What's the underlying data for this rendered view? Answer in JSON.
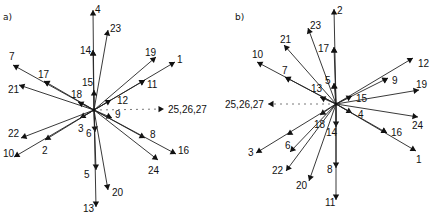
{
  "panels": [
    {
      "label": "a)",
      "center": [
        94,
        110
      ],
      "vectors": [
        {
          "id": "4",
          "end": [
            93,
            10
          ],
          "label_pos": [
            95,
            13
          ],
          "marks": [
            [
              93,
              50
            ]
          ]
        },
        {
          "id": "23",
          "end": [
            108,
            30
          ],
          "label_pos": [
            110,
            32
          ],
          "marks": []
        },
        {
          "id": "14",
          "end": [
            93,
            50
          ],
          "label_pos": [
            80,
            54
          ],
          "marks": []
        },
        {
          "id": "15",
          "end": [
            94,
            90
          ],
          "label_pos": [
            82,
            86
          ],
          "marks": []
        },
        {
          "id": "19",
          "end": [
            156,
            57
          ],
          "label_pos": [
            145,
            56
          ],
          "marks": []
        },
        {
          "id": "1",
          "end": [
            175,
            62
          ],
          "label_pos": [
            177,
            63
          ],
          "marks": [
            [
              145,
              80
            ]
          ]
        },
        {
          "id": "11",
          "end": [
            145,
            80
          ],
          "label_pos": [
            147,
            88
          ],
          "marks": []
        },
        {
          "id": "12",
          "end": [
            111,
            100
          ],
          "label_pos": [
            117,
            104
          ],
          "marks": []
        },
        {
          "id": "7",
          "end": [
            13,
            65
          ],
          "label_pos": [
            9,
            60
          ],
          "marks": [
            [
              44,
              81
            ]
          ]
        },
        {
          "id": "17",
          "end": [
            44,
            81
          ],
          "label_pos": [
            38,
            78
          ],
          "marks": []
        },
        {
          "id": "21",
          "end": [
            19,
            85
          ],
          "label_pos": [
            8,
            93
          ],
          "marks": []
        },
        {
          "id": "18",
          "end": [
            78,
            102
          ],
          "label_pos": [
            71,
            98
          ],
          "marks": []
        },
        {
          "id": "9",
          "end": [
            112,
            118
          ],
          "label_pos": [
            115,
            118
          ],
          "marks": []
        },
        {
          "id": "8",
          "end": [
            145,
            138
          ],
          "label_pos": [
            150,
            138
          ],
          "marks": []
        },
        {
          "id": "16",
          "end": [
            176,
            154
          ],
          "label_pos": [
            178,
            154
          ],
          "marks": []
        },
        {
          "id": "24",
          "end": [
            158,
            160
          ],
          "label_pos": [
            148,
            174
          ],
          "marks": []
        },
        {
          "id": "3",
          "end": [
            80,
            118
          ],
          "label_pos": [
            78,
            132
          ],
          "marks": []
        },
        {
          "id": "22",
          "end": [
            21,
            138
          ],
          "label_pos": [
            8,
            137
          ],
          "marks": []
        },
        {
          "id": "2",
          "end": [
            45,
            140
          ],
          "label_pos": [
            42,
            154
          ],
          "marks": []
        },
        {
          "id": "10",
          "end": [
            14,
            157
          ],
          "label_pos": [
            3,
            157
          ],
          "marks": []
        },
        {
          "id": "6",
          "end": [
            95,
            132
          ],
          "label_pos": [
            86,
            137
          ],
          "marks": []
        },
        {
          "id": "5",
          "end": [
            96,
            170
          ],
          "label_pos": [
            84,
            178
          ],
          "marks": []
        },
        {
          "id": "13",
          "end": [
            96,
            207
          ],
          "label_pos": [
            83,
            212
          ],
          "marks": []
        },
        {
          "id": "20",
          "end": [
            108,
            190
          ],
          "label_pos": [
            112,
            196
          ],
          "marks": []
        }
      ],
      "dashed": {
        "label": "25,26,27",
        "end": [
          164,
          109
        ],
        "label_pos": [
          168,
          113
        ],
        "direction": "right"
      }
    },
    {
      "label": "b)",
      "center": [
        336,
        104
      ],
      "vectors": [
        {
          "id": "2",
          "end": [
            334,
            9
          ],
          "label_pos": [
            337,
            14
          ],
          "marks": [
            [
              334,
              47
            ],
            [
              334,
              83
            ]
          ]
        },
        {
          "id": "23",
          "end": [
            308,
            28
          ],
          "label_pos": [
            310,
            29
          ],
          "marks": []
        },
        {
          "id": "17",
          "end": [
            334,
            47
          ],
          "label_pos": [
            318,
            52
          ],
          "marks": []
        },
        {
          "id": "5",
          "end": [
            334,
            83
          ],
          "label_pos": [
            325,
            84
          ],
          "marks": []
        },
        {
          "id": "21",
          "end": [
            284,
            45
          ],
          "label_pos": [
            280,
            43
          ],
          "marks": []
        },
        {
          "id": "10",
          "end": [
            257,
            62
          ],
          "label_pos": [
            252,
            58
          ],
          "marks": [
            [
              285,
              77
            ]
          ]
        },
        {
          "id": "7",
          "end": [
            285,
            77
          ],
          "label_pos": [
            282,
            74
          ],
          "marks": []
        },
        {
          "id": "13",
          "end": [
            320,
            97
          ],
          "label_pos": [
            311,
            92
          ],
          "marks": []
        },
        {
          "id": "12",
          "end": [
            413,
            58
          ],
          "label_pos": [
            418,
            67
          ],
          "marks": [
            [
              388,
              78
            ]
          ]
        },
        {
          "id": "9",
          "end": [
            388,
            78
          ],
          "label_pos": [
            392,
            84
          ],
          "marks": []
        },
        {
          "id": "19",
          "end": [
            419,
            90
          ],
          "label_pos": [
            416,
            88
          ],
          "marks": []
        },
        {
          "id": "15",
          "end": [
            352,
            96
          ],
          "label_pos": [
            356,
            102
          ],
          "marks": []
        },
        {
          "id": "4",
          "end": [
            352,
            113
          ],
          "label_pos": [
            358,
            118
          ],
          "marks": []
        },
        {
          "id": "24",
          "end": [
            418,
            117
          ],
          "label_pos": [
            412,
            129
          ],
          "marks": []
        },
        {
          "id": "16",
          "end": [
            387,
            133
          ],
          "label_pos": [
            391,
            136
          ],
          "marks": []
        },
        {
          "id": "1",
          "end": [
            416,
            151
          ],
          "label_pos": [
            416,
            163
          ],
          "marks": [
            [
              387,
              133
            ]
          ]
        },
        {
          "id": "18",
          "end": [
            320,
            115
          ],
          "label_pos": [
            314,
            128
          ],
          "marks": []
        },
        {
          "id": "3",
          "end": [
            256,
            153
          ],
          "label_pos": [
            248,
            156
          ],
          "marks": [
            [
              287,
              135
            ]
          ]
        },
        {
          "id": "14",
          "end": [
            336,
            127
          ],
          "label_pos": [
            326,
            136
          ],
          "marks": []
        },
        {
          "id": "8",
          "end": [
            336,
            168
          ],
          "label_pos": [
            327,
            173
          ],
          "marks": []
        },
        {
          "id": "11",
          "end": [
            336,
            200
          ],
          "label_pos": [
            325,
            206
          ],
          "marks": []
        },
        {
          "id": "6",
          "end": [
            290,
            152
          ],
          "label_pos": [
            285,
            149
          ],
          "marks": []
        },
        {
          "id": "22",
          "end": [
            286,
            171
          ],
          "label_pos": [
            272,
            174
          ],
          "marks": []
        },
        {
          "id": "20",
          "end": [
            309,
            181
          ],
          "label_pos": [
            296,
            189
          ],
          "marks": []
        }
      ],
      "dashed": {
        "label": "25,26,27",
        "end": [
          268,
          104
        ],
        "label_pos": [
          225,
          108
        ],
        "direction": "left"
      }
    }
  ]
}
